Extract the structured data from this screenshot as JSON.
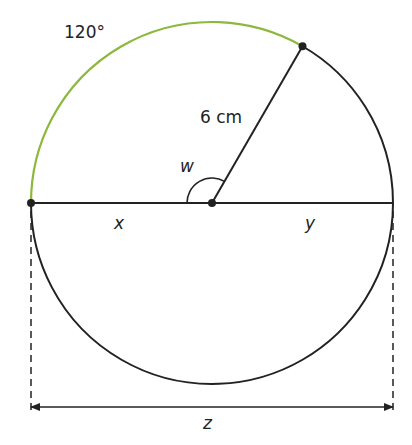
{
  "diagram": {
    "type": "circle-geometry",
    "radius_label": "6 cm",
    "arc_label": "120°",
    "angle_label": "w",
    "segment_left_label": "x",
    "segment_right_label": "y",
    "diameter_label": "z",
    "arc_angle_degrees": 120,
    "colors": {
      "highlight_arc": "#8cb83c",
      "line": "#222222"
    }
  }
}
